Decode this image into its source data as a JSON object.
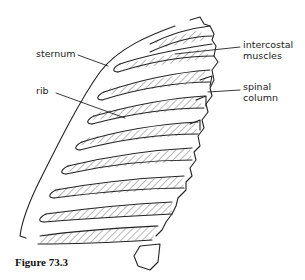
{
  "figure": {
    "caption": "Figure 73.3",
    "labels": {
      "sternum": "sternum",
      "rib": "rib",
      "intercostal_line1": "intercostal",
      "intercostal_line2": "muscles",
      "spinal_line1": "spinal",
      "spinal_line2": "column"
    },
    "colors": {
      "line": "#222222",
      "background": "#ffffff"
    }
  }
}
